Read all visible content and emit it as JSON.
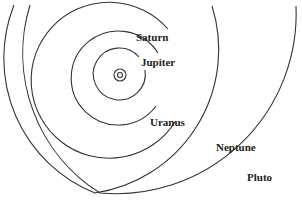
{
  "diagram": {
    "labels": {
      "saturn": "Saturn",
      "jupiter": "Jupiter",
      "uranus": "Uranus",
      "neptune": "Neptune",
      "pluto": "Pluto"
    },
    "stroke_color": "#333333",
    "background": "#ffffff"
  }
}
